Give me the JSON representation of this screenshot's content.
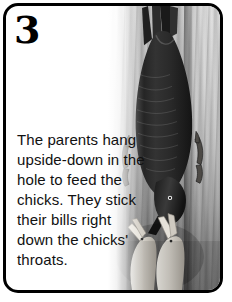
{
  "panel": {
    "number": "3",
    "caption": "The parents hang upside-down in the hole to feed the chicks. They stick their bills right down the chicks' throats.",
    "border_color": "#000000",
    "background_color": "#ffffff"
  },
  "illustration": {
    "alt_name": "woodpecker-feeding-chicks",
    "description": "A dark woodpecker hangs upside-down on a tree trunk feeding two bare chicks that reach up with open beaks.",
    "subjects": [
      {
        "name": "tree-bark",
        "tone": "#c2c2c2"
      },
      {
        "name": "adult-bird",
        "tone": "#2a2a2a"
      },
      {
        "name": "bird-foot-left",
        "tone": "#4a4a4a"
      },
      {
        "name": "bird-foot-right",
        "tone": "#4a4a4a"
      },
      {
        "name": "chick-left",
        "tone": "#d8d4cc"
      },
      {
        "name": "chick-right",
        "tone": "#d8d4cc"
      }
    ],
    "palette": {
      "bark_light": "#e3e3e3",
      "bark_mid": "#c2c2c2",
      "bark_dark": "#7c7c7c",
      "bird_dark": "#2a2a2a",
      "chick_pale": "#d8d4cc"
    }
  }
}
